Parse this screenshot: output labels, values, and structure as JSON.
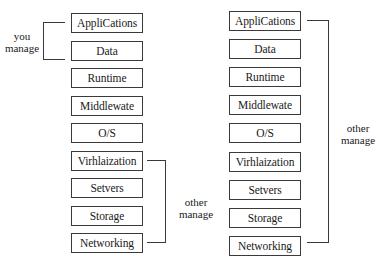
{
  "left_stack": {
    "layers": [
      {
        "label": "AppliCations"
      },
      {
        "label": "Data"
      },
      {
        "label": "Runtime"
      },
      {
        "label": "Middlewate"
      },
      {
        "label": "O/S"
      },
      {
        "label": "Virhlaization"
      },
      {
        "label": "Setvers"
      },
      {
        "label": "Storage"
      },
      {
        "label": "Networking"
      }
    ],
    "you_manage_label_line1": "you",
    "you_manage_label_line2": "manage",
    "other_manage_label_line1": "other",
    "other_manage_label_line2": "manage"
  },
  "right_stack": {
    "layers": [
      {
        "label": "AppliCations"
      },
      {
        "label": "Data"
      },
      {
        "label": "Runtime"
      },
      {
        "label": "Middlewate"
      },
      {
        "label": "O/S"
      },
      {
        "label": "Virhlaization"
      },
      {
        "label": "Setvers"
      },
      {
        "label": "Storage"
      },
      {
        "label": "Networking"
      }
    ],
    "other_manage_label_line1": "other",
    "other_manage_label_line2": "manage"
  },
  "colors": {
    "stroke": "#3a3a3a",
    "text": "#1a1a1a",
    "background": "#ffffff"
  }
}
